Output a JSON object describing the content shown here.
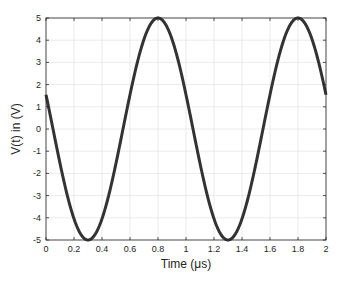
{
  "chart_data": {
    "type": "line",
    "title": "",
    "xlabel": "Time (μs)",
    "ylabel": "V(t) in (V)",
    "xlim": [
      0,
      2
    ],
    "ylim": [
      -5,
      5
    ],
    "xticks": [
      0,
      0.2,
      0.4,
      0.6,
      0.8,
      1,
      1.2,
      1.4,
      1.6,
      1.8,
      2
    ],
    "xtick_labels": [
      "0",
      "0.2",
      "0.4",
      "0.6",
      "0.8",
      "1",
      "1.2",
      "1.4",
      "1.6",
      "1.8",
      "2"
    ],
    "yticks": [
      -5,
      -4,
      -3,
      -2,
      -1,
      0,
      1,
      2,
      3,
      4,
      5
    ],
    "ytick_labels": [
      "-5",
      "-4",
      "-3",
      "-2",
      "-1",
      "0",
      "1",
      "2",
      "3",
      "4",
      "5"
    ],
    "grid": true,
    "legend": null,
    "series": [
      {
        "name": "V(t)",
        "color": "#333333",
        "line_width": 3,
        "formula": "5*cos(2*pi*(t-0.8))",
        "x": [
          0,
          0.1,
          0.2,
          0.3,
          0.4,
          0.5,
          0.6,
          0.7,
          0.8,
          0.9,
          1.0,
          1.1,
          1.2,
          1.3,
          1.4,
          1.5,
          1.6,
          1.7,
          1.8,
          1.9,
          2.0
        ],
        "values": [
          1.55,
          -1.55,
          -4.05,
          -5.0,
          -4.05,
          -1.55,
          1.55,
          4.05,
          5.0,
          4.05,
          1.55,
          -1.55,
          -4.05,
          -5.0,
          -4.05,
          -1.55,
          1.55,
          4.05,
          5.0,
          4.05,
          1.55
        ]
      }
    ]
  },
  "colors": {
    "axis": "#262626",
    "grid": "#e6e6e6",
    "line": "#333333",
    "background": "#ffffff"
  }
}
